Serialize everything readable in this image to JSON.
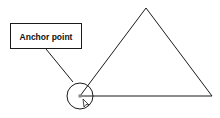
{
  "diagram": {
    "callout_label": "Anchor point",
    "colors": {
      "stroke": "#1a1a1a",
      "background": "#ffffff",
      "anchor_fill": "#888888"
    },
    "shape": "triangle",
    "highlighted_vertex": "bottom-left",
    "cursor_icon": "arrow-pointer-icon"
  }
}
